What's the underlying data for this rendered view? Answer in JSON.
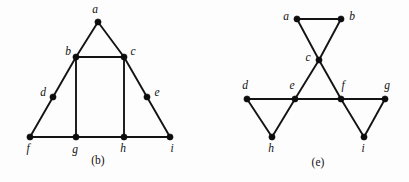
{
  "figure": {
    "background_color": "#fdfdfd",
    "ink_color": "#141414",
    "vertex_color": "#0d0d0d",
    "width": 409,
    "height": 182,
    "panels": [
      {
        "id": "panel-b",
        "caption": "(b)",
        "caption_x": 98,
        "caption_y": 164,
        "description": "triangle graph with interior rectangle",
        "vertices": [
          {
            "id": "a",
            "label": "a",
            "x": 98,
            "y": 22,
            "label_x": 95,
            "label_y": 13,
            "anchor": "middle"
          },
          {
            "id": "b",
            "label": "b",
            "x": 76,
            "y": 57,
            "label_x": 68,
            "label_y": 55,
            "anchor": "middle"
          },
          {
            "id": "c",
            "label": "c",
            "x": 124,
            "y": 57,
            "label_x": 133,
            "label_y": 55,
            "anchor": "middle"
          },
          {
            "id": "d",
            "label": "d",
            "x": 53,
            "y": 97,
            "label_x": 43,
            "label_y": 96,
            "anchor": "middle"
          },
          {
            "id": "e",
            "label": "e",
            "x": 147,
            "y": 97,
            "label_x": 157,
            "label_y": 96,
            "anchor": "middle"
          },
          {
            "id": "f",
            "label": "f",
            "x": 30,
            "y": 137,
            "label_x": 28,
            "label_y": 152,
            "anchor": "middle"
          },
          {
            "id": "g",
            "label": "g",
            "x": 76,
            "y": 137,
            "label_x": 75,
            "label_y": 153,
            "anchor": "middle"
          },
          {
            "id": "h",
            "label": "h",
            "x": 124,
            "y": 137,
            "label_x": 123,
            "label_y": 152,
            "anchor": "middle"
          },
          {
            "id": "i",
            "label": "i",
            "x": 170,
            "y": 137,
            "label_x": 172,
            "label_y": 152,
            "anchor": "middle"
          }
        ],
        "edges": [
          {
            "from": "a",
            "to": "b"
          },
          {
            "from": "a",
            "to": "c"
          },
          {
            "from": "b",
            "to": "c"
          },
          {
            "from": "b",
            "to": "d"
          },
          {
            "from": "b",
            "to": "g"
          },
          {
            "from": "c",
            "to": "e"
          },
          {
            "from": "c",
            "to": "h"
          },
          {
            "from": "d",
            "to": "f"
          },
          {
            "from": "e",
            "to": "i"
          },
          {
            "from": "f",
            "to": "g"
          },
          {
            "from": "g",
            "to": "h"
          },
          {
            "from": "h",
            "to": "i"
          }
        ]
      },
      {
        "id": "panel-e",
        "caption": "(e)",
        "caption_x": 318,
        "caption_y": 166,
        "description": "three triangles joined at a horizontal spine",
        "vertices": [
          {
            "id": "a",
            "label": "a",
            "x": 297,
            "y": 19,
            "label_x": 286,
            "label_y": 20,
            "anchor": "middle"
          },
          {
            "id": "b",
            "label": "b",
            "x": 341,
            "y": 19,
            "label_x": 352,
            "label_y": 20,
            "anchor": "middle"
          },
          {
            "id": "c",
            "label": "c",
            "x": 319,
            "y": 60,
            "label_x": 308,
            "label_y": 61,
            "anchor": "middle"
          },
          {
            "id": "d",
            "label": "d",
            "x": 247,
            "y": 99,
            "label_x": 245,
            "label_y": 89,
            "anchor": "middle"
          },
          {
            "id": "e",
            "label": "e",
            "x": 295,
            "y": 99,
            "label_x": 292,
            "label_y": 89,
            "anchor": "middle"
          },
          {
            "id": "f",
            "label": "f",
            "x": 341,
            "y": 99,
            "label_x": 343,
            "label_y": 89,
            "anchor": "middle"
          },
          {
            "id": "g",
            "label": "g",
            "x": 385,
            "y": 99,
            "label_x": 387,
            "label_y": 89,
            "anchor": "middle"
          },
          {
            "id": "h",
            "label": "h",
            "x": 272,
            "y": 137,
            "label_x": 271,
            "label_y": 152,
            "anchor": "middle"
          },
          {
            "id": "i",
            "label": "i",
            "x": 364,
            "y": 137,
            "label_x": 363,
            "label_y": 152,
            "anchor": "middle"
          }
        ],
        "edges": [
          {
            "from": "a",
            "to": "b"
          },
          {
            "from": "a",
            "to": "c"
          },
          {
            "from": "b",
            "to": "c"
          },
          {
            "from": "c",
            "to": "e"
          },
          {
            "from": "c",
            "to": "f"
          },
          {
            "from": "d",
            "to": "e"
          },
          {
            "from": "e",
            "to": "f"
          },
          {
            "from": "f",
            "to": "g"
          },
          {
            "from": "d",
            "to": "h"
          },
          {
            "from": "e",
            "to": "h"
          },
          {
            "from": "f",
            "to": "i"
          },
          {
            "from": "g",
            "to": "i"
          }
        ]
      }
    ]
  }
}
